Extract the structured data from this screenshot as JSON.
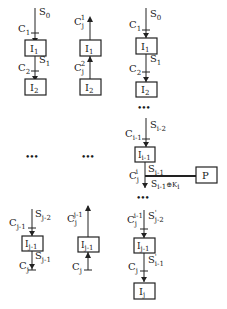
{
  "diagram": {
    "type": "process-chain-diagram",
    "columns": [
      {
        "id": "col1",
        "top": {
          "input_state": "S0",
          "nodes": [
            {
              "label": "I1",
              "in_cond": "C1",
              "out_state": "S1"
            },
            {
              "label": "I2",
              "in_cond": "C2"
            }
          ]
        },
        "ellipsis": "•••",
        "bottom": {
          "in_state": "Sj-2",
          "in_cond": "Cj-1",
          "node": "Ij-1",
          "out_state": "Sj-1",
          "out_cond": "Cj"
        }
      },
      {
        "id": "col2",
        "top": {
          "nodes": [
            {
              "label": "I1",
              "out_cond": "Cj1"
            },
            {
              "label": "I2",
              "link_cond": "Cj2"
            }
          ]
        },
        "ellipsis": "•••",
        "bottom": {
          "node": "Ij-1",
          "out_cond": "Cjj-1",
          "in_cond": "Cj"
        }
      },
      {
        "id": "col3",
        "top": {
          "input_state": "S0",
          "nodes": [
            {
              "label": "I1",
              "in_cond": "C1",
              "out_state": "S1"
            },
            {
              "label": "I2",
              "in_cond": "C2"
            }
          ]
        },
        "ellipsis_1": "•••",
        "middle": {
          "in_state": "Si-2",
          "in_cond": "Ci-1",
          "node": "Ii-1",
          "out_state": "Si-1",
          "branch_cond": "Cji",
          "branch_label": "Si-1⊕Ki",
          "branch_target": "P"
        },
        "ellipsis_2": "•••",
        "bottom": {
          "in_cond": "Cji-1",
          "in_state": "S'j-2",
          "node": "Ij-1",
          "out_state": "S'i-1",
          "out_cond": "Cj",
          "final_node": "Ij"
        }
      }
    ]
  },
  "text": {
    "S": "S",
    "C": "C",
    "I": "I",
    "P": "P",
    "s0": "0",
    "s1": "1",
    "s2": "2",
    "j": "j",
    "i": "i",
    "jm1": "j-1",
    "jm2": "j-2",
    "im1": "i-1",
    "im2": "i-2",
    "ki_text": "S",
    "ki_sub": "i-1",
    "ki_mid": "⊕K",
    "ki_sub2": "i",
    "dots": "•••",
    "prime": "'"
  }
}
